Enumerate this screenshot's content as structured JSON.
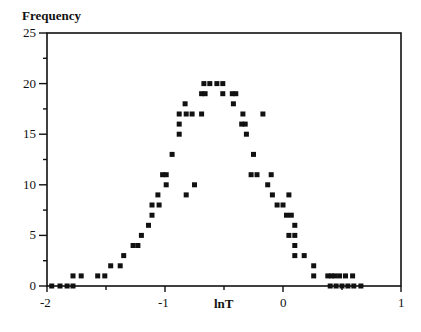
{
  "chart_data": {
    "type": "scatter",
    "title": "",
    "xlabel": "lnT",
    "ylabel": "Frequency",
    "xlim": [
      -2,
      1
    ],
    "ylim": [
      0,
      25
    ],
    "grid": false,
    "legend": null,
    "x_ticks": [
      "-2",
      "-1",
      "0",
      "1"
    ],
    "y_ticks": [
      "0",
      "5",
      "10",
      "15",
      "20",
      "25"
    ],
    "marker": "square",
    "marker_color": "#111111",
    "points": [
      [
        -1.96,
        0
      ],
      [
        -1.89,
        0
      ],
      [
        -1.83,
        0
      ],
      [
        -1.78,
        0
      ],
      [
        -1.78,
        1
      ],
      [
        -1.71,
        1
      ],
      [
        -1.57,
        1
      ],
      [
        -1.51,
        1
      ],
      [
        -1.46,
        2
      ],
      [
        -1.38,
        2
      ],
      [
        -1.35,
        3
      ],
      [
        -1.27,
        4
      ],
      [
        -1.23,
        4
      ],
      [
        -1.2,
        5
      ],
      [
        -1.14,
        6
      ],
      [
        -1.11,
        7
      ],
      [
        -1.11,
        8
      ],
      [
        -1.05,
        8
      ],
      [
        -1.06,
        9
      ],
      [
        -0.99,
        10
      ],
      [
        -1.02,
        11
      ],
      [
        -0.99,
        11
      ],
      [
        -0.94,
        13
      ],
      [
        -0.88,
        15
      ],
      [
        -0.88,
        16
      ],
      [
        -0.88,
        17
      ],
      [
        -0.83,
        18
      ],
      [
        -0.82,
        17
      ],
      [
        -0.77,
        17
      ],
      [
        -0.69,
        17
      ],
      [
        -0.82,
        9
      ],
      [
        -0.75,
        10
      ],
      [
        -0.69,
        19
      ],
      [
        -0.66,
        19
      ],
      [
        -0.67,
        20
      ],
      [
        -0.62,
        20
      ],
      [
        -0.56,
        20
      ],
      [
        -0.51,
        20
      ],
      [
        -0.51,
        19
      ],
      [
        -0.43,
        19
      ],
      [
        -0.4,
        19
      ],
      [
        -0.42,
        18
      ],
      [
        -0.34,
        17
      ],
      [
        -0.17,
        17
      ],
      [
        -0.35,
        16
      ],
      [
        -0.32,
        16
      ],
      [
        -0.31,
        15
      ],
      [
        -0.25,
        13
      ],
      [
        -0.27,
        11
      ],
      [
        -0.22,
        11
      ],
      [
        -0.1,
        11
      ],
      [
        -0.13,
        10
      ],
      [
        -0.09,
        9
      ],
      [
        0.05,
        9
      ],
      [
        -0.05,
        8
      ],
      [
        0.0,
        8
      ],
      [
        0.03,
        7
      ],
      [
        0.07,
        7
      ],
      [
        0.1,
        6
      ],
      [
        0.05,
        5
      ],
      [
        0.1,
        5
      ],
      [
        0.1,
        4
      ],
      [
        0.1,
        3
      ],
      [
        0.18,
        3
      ],
      [
        0.26,
        2
      ],
      [
        0.26,
        1
      ],
      [
        0.38,
        1
      ],
      [
        0.41,
        1
      ],
      [
        0.44,
        1
      ],
      [
        0.48,
        1
      ],
      [
        0.53,
        1
      ],
      [
        0.59,
        1
      ],
      [
        0.4,
        0
      ],
      [
        0.45,
        0
      ],
      [
        0.5,
        0
      ],
      [
        0.55,
        0
      ],
      [
        0.6,
        0
      ],
      [
        0.66,
        0
      ]
    ]
  },
  "labels": {
    "ylabel": "Frequency",
    "xlabel": "lnT",
    "x_ticks": [
      "-2",
      "-1",
      "0",
      "1"
    ],
    "y_ticks": [
      "0",
      "5",
      "10",
      "15",
      "20",
      "25"
    ]
  }
}
